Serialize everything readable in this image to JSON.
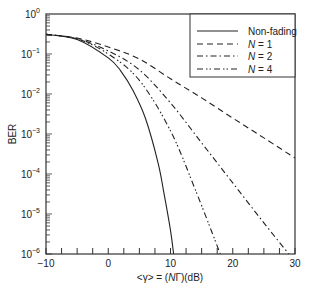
{
  "chart_data": {
    "type": "line",
    "title": "",
    "xlabel": "<γ> = (NΓ)(dB)",
    "ylabel": "BER",
    "xlim": [
      -10,
      30
    ],
    "ylim": [
      1e-06,
      1
    ],
    "yscale": "log",
    "grid": false,
    "legend_position": "upper right",
    "x_ticks": [
      "−10",
      "0",
      "10",
      "20",
      "30"
    ],
    "y_ticks": [
      "10^0",
      "10^-1",
      "10^-2",
      "10^-3",
      "10^-4",
      "10^-5",
      "10^-6"
    ],
    "series": [
      {
        "name": "Non-fading",
        "style": "solid",
        "x": [
          -10,
          -5,
          0,
          2,
          4,
          6,
          8,
          9,
          10,
          10.5
        ],
        "y": [
          0.31,
          0.23,
          0.08,
          0.038,
          0.012,
          0.0024,
          0.00019,
          3e-05,
          3.9e-06,
          1e-06
        ]
      },
      {
        "name": "N = 1",
        "style": "dashed",
        "x": [
          -10,
          -5,
          0,
          5,
          10,
          15,
          20,
          25,
          30
        ],
        "y": [
          0.31,
          0.25,
          0.15,
          0.075,
          0.024,
          0.008,
          0.0025,
          0.0008,
          0.00025
        ]
      },
      {
        "name": "N = 2",
        "style": "dash-dot",
        "x": [
          -10,
          -5,
          0,
          5,
          10,
          15,
          20,
          25,
          29
        ],
        "y": [
          0.31,
          0.24,
          0.12,
          0.04,
          0.006,
          0.0006,
          6e-05,
          6e-06,
          1e-06
        ]
      },
      {
        "name": "N = 4",
        "style": "dash-dot-dot",
        "x": [
          -10,
          -5,
          0,
          5,
          10,
          14,
          18
        ],
        "y": [
          0.31,
          0.24,
          0.1,
          0.022,
          0.0012,
          4e-05,
          1e-06
        ]
      }
    ]
  },
  "legend": {
    "items": [
      "Non-fading",
      "N = 1",
      "N = 2",
      "N = 4"
    ],
    "n_italic": "N",
    "eq": [
      "= 1",
      "= 2",
      "= 4"
    ]
  },
  "axes": {
    "xlabel_parts": {
      "pre": "<γ> = (",
      "n": "N",
      "gamma": "Γ",
      "post": ")(dB)"
    },
    "ylabel": "BER"
  }
}
